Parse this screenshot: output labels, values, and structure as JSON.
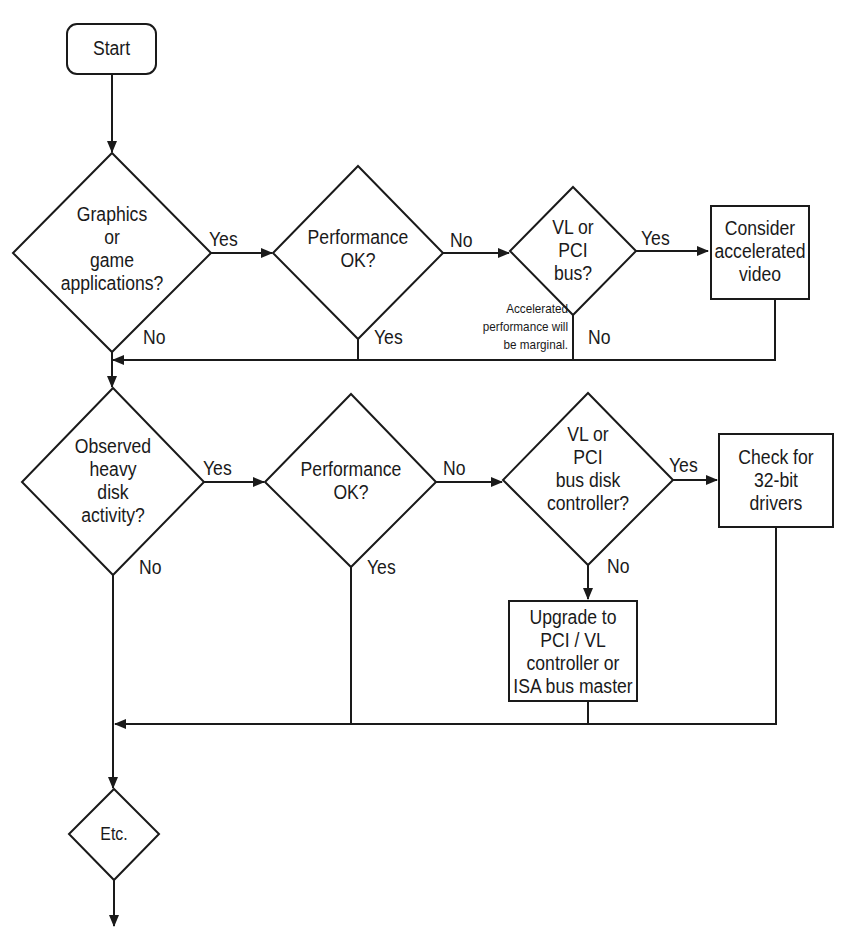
{
  "diagram": {
    "type": "flowchart",
    "nodes": {
      "start": {
        "kind": "terminator",
        "text": "Start"
      },
      "graphics_q": {
        "kind": "decision",
        "text": "Graphics\nor\ngame\napplications?"
      },
      "perf1_q": {
        "kind": "decision",
        "text": "Performance\nOK?"
      },
      "vlpci_bus_q": {
        "kind": "decision",
        "text": "VL or\nPCI\nbus?"
      },
      "accel_video": {
        "kind": "process",
        "text": "Consider\naccelerated\nvideo"
      },
      "disk_q": {
        "kind": "decision",
        "text": "Observed\nheavy\ndisk\nactivity?"
      },
      "perf2_q": {
        "kind": "decision",
        "text": "Performance\nOK?"
      },
      "vlpci_disk_q": {
        "kind": "decision",
        "text": "VL or\nPCI\nbus disk\ncontroller?"
      },
      "check_drivers": {
        "kind": "process",
        "text": "Check for\n32-bit\ndrivers"
      },
      "upgrade": {
        "kind": "process",
        "text": "Upgrade to\nPCI / VL\ncontroller or\nISA bus master"
      },
      "etc": {
        "kind": "decision",
        "text": "Etc."
      }
    },
    "edge_labels": {
      "graphics_yes": "Yes",
      "graphics_no": "No",
      "perf1_no": "No",
      "perf1_yes": "Yes",
      "vlpci_bus_yes": "Yes",
      "vlpci_bus_no": "No",
      "disk_yes": "Yes",
      "disk_no": "No",
      "perf2_no": "No",
      "perf2_yes": "Yes",
      "vlpci_disk_yes": "Yes",
      "vlpci_disk_no": "No"
    },
    "annotations": {
      "marginal_note": "Accelerated\nperformance will\nbe marginal."
    },
    "edges": [
      {
        "from": "start",
        "to": "graphics_q"
      },
      {
        "from": "graphics_q",
        "to": "perf1_q",
        "label": "Yes"
      },
      {
        "from": "graphics_q",
        "to": "disk_q",
        "label": "No"
      },
      {
        "from": "perf1_q",
        "to": "vlpci_bus_q",
        "label": "No"
      },
      {
        "from": "perf1_q",
        "to": "disk_q",
        "label": "Yes"
      },
      {
        "from": "vlpci_bus_q",
        "to": "accel_video",
        "label": "Yes"
      },
      {
        "from": "vlpci_bus_q",
        "to": "disk_q",
        "label": "No"
      },
      {
        "from": "accel_video",
        "to": "disk_q"
      },
      {
        "from": "disk_q",
        "to": "perf2_q",
        "label": "Yes"
      },
      {
        "from": "disk_q",
        "to": "etc",
        "label": "No"
      },
      {
        "from": "perf2_q",
        "to": "vlpci_disk_q",
        "label": "No"
      },
      {
        "from": "perf2_q",
        "to": "etc",
        "label": "Yes"
      },
      {
        "from": "vlpci_disk_q",
        "to": "check_drivers",
        "label": "Yes"
      },
      {
        "from": "vlpci_disk_q",
        "to": "upgrade",
        "label": "No"
      },
      {
        "from": "check_drivers",
        "to": "etc"
      },
      {
        "from": "upgrade",
        "to": "etc"
      },
      {
        "from": "etc",
        "to": "continues"
      }
    ]
  }
}
